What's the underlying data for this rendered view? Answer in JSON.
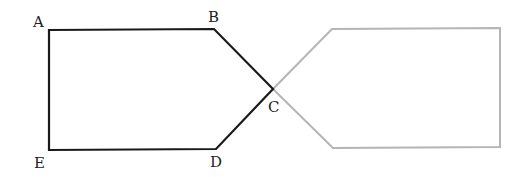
{
  "diagram": {
    "colors": {
      "primary_stroke": "#1a1a1a",
      "reflected_stroke": "#b5b5b5",
      "background": "#ffffff"
    },
    "labels": {
      "A": "A",
      "B": "B",
      "C": "C",
      "D": "D",
      "E": "E"
    },
    "primary_shape": {
      "vertices": [
        {
          "name": "A",
          "x": 49,
          "y": 30
        },
        {
          "name": "B",
          "x": 214,
          "y": 29
        },
        {
          "name": "C",
          "x": 273,
          "y": 89
        },
        {
          "name": "D",
          "x": 216,
          "y": 149
        },
        {
          "name": "E",
          "x": 49,
          "y": 150
        }
      ]
    },
    "reflected_shape": {
      "vertices": [
        {
          "x": 273,
          "y": 89
        },
        {
          "x": 332,
          "y": 29
        },
        {
          "x": 500,
          "y": 28
        },
        {
          "x": 500,
          "y": 147
        },
        {
          "x": 333,
          "y": 148
        }
      ]
    }
  }
}
